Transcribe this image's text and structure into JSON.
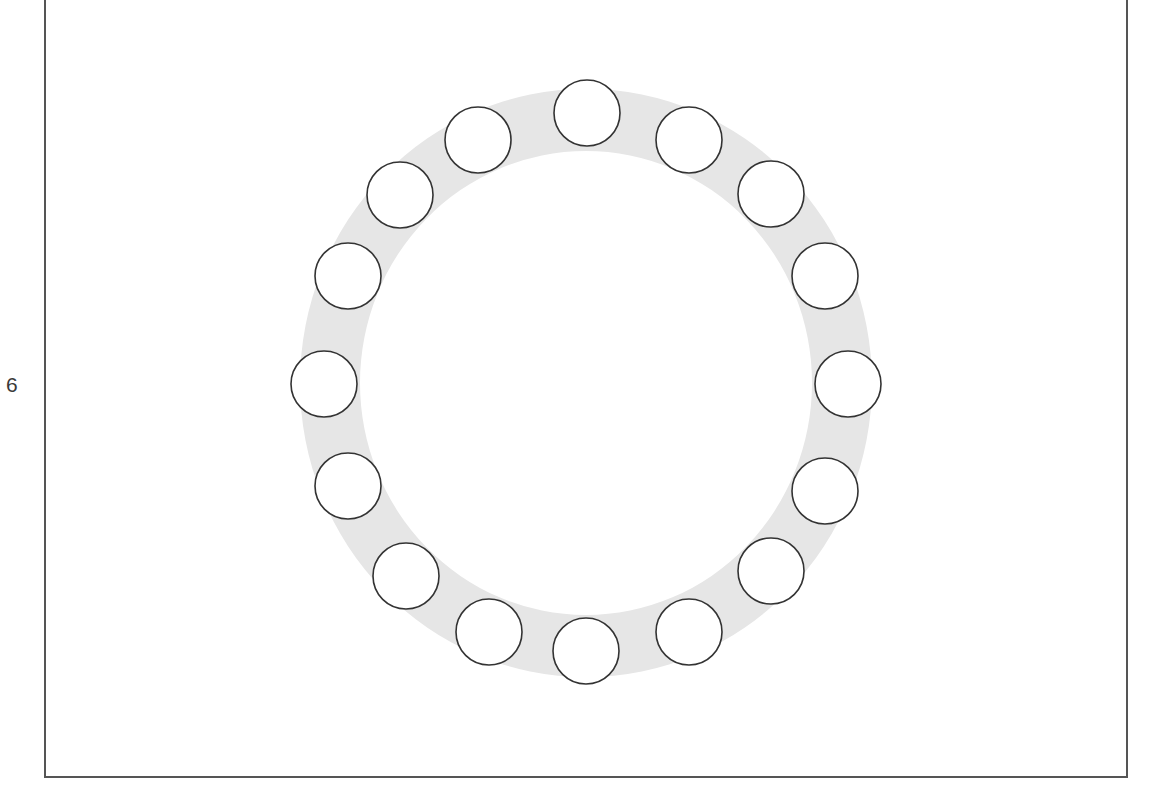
{
  "page": {
    "side_label": "6"
  },
  "diagram": {
    "type": "circular-arrangement",
    "ring": {
      "cx": 586,
      "cy": 383,
      "outer_rx": 286,
      "outer_ry": 294,
      "inner_rx": 226,
      "inner_ry": 232,
      "fill": "#e6e6e6"
    },
    "node_radius": 33,
    "node_stroke": "#333333",
    "node_fill": "#ffffff",
    "nodes": [
      {
        "id": 1,
        "cx": 587,
        "cy": 113
      },
      {
        "id": 2,
        "cx": 689,
        "cy": 140
      },
      {
        "id": 3,
        "cx": 771,
        "cy": 194
      },
      {
        "id": 4,
        "cx": 825,
        "cy": 276
      },
      {
        "id": 5,
        "cx": 848,
        "cy": 384
      },
      {
        "id": 6,
        "cx": 825,
        "cy": 491
      },
      {
        "id": 7,
        "cx": 771,
        "cy": 571
      },
      {
        "id": 8,
        "cx": 689,
        "cy": 632
      },
      {
        "id": 9,
        "cx": 586,
        "cy": 651
      },
      {
        "id": 10,
        "cx": 489,
        "cy": 632
      },
      {
        "id": 11,
        "cx": 406,
        "cy": 576
      },
      {
        "id": 12,
        "cx": 348,
        "cy": 486
      },
      {
        "id": 13,
        "cx": 324,
        "cy": 384
      },
      {
        "id": 14,
        "cx": 348,
        "cy": 276
      },
      {
        "id": 15,
        "cx": 400,
        "cy": 195
      },
      {
        "id": 16,
        "cx": 478,
        "cy": 140
      }
    ]
  },
  "colors": {
    "frame": "#555555",
    "ring": "#e6e6e6",
    "node_stroke": "#333333",
    "text": "#3a3a3a"
  }
}
